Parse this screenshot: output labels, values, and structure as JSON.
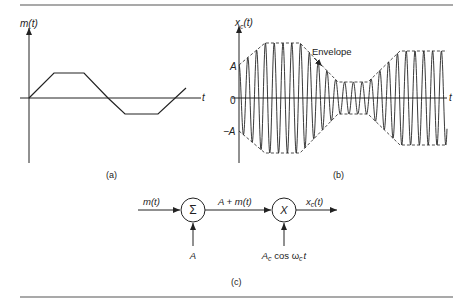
{
  "figure": {
    "panel_a": {
      "caption": "(a)",
      "y_label": "m(t)",
      "x_label": "t",
      "signal_points": [
        [
          29,
          98
        ],
        [
          54,
          73
        ],
        [
          84,
          73
        ],
        [
          108,
          98
        ],
        [
          125,
          114
        ],
        [
          158,
          114
        ],
        [
          186,
          88
        ]
      ]
    },
    "panel_b": {
      "caption": "(b)",
      "y_label": "x",
      "y_label_sub": "c",
      "y_label_arg": "(t)",
      "x_label": "t",
      "tick_pos": "A",
      "tick_zero": "0",
      "tick_neg": "−A",
      "annotation": "Envelope"
    },
    "panel_c": {
      "caption": "(c)",
      "input_label": "m(t)",
      "summer_symbol": "Σ",
      "summer_input": "A",
      "intermediate_label": "A + m(t)",
      "multiplier_symbol": "X",
      "output_label_main": "x",
      "output_label_sub": "c",
      "output_label_arg": "(t)",
      "carrier_A": "A",
      "carrier_A_sub": "c",
      "carrier_cos": " cos ω",
      "carrier_w_sub": "c",
      "carrier_t": "t"
    },
    "colors": {
      "ink": "#222222",
      "rule": "#555555"
    }
  }
}
